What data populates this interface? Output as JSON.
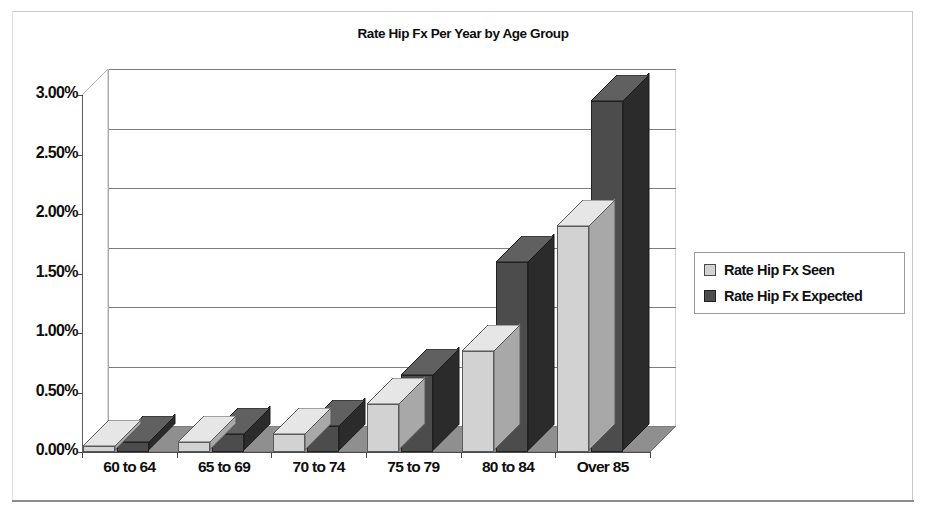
{
  "frame": {
    "present": true
  },
  "chart_data": {
    "type": "bar",
    "title": "Rate Hip Fx Per Year by Age Group",
    "xlabel": "",
    "ylabel": "",
    "categories": [
      "60 to 64",
      "65 to 69",
      "70 to 74",
      "75 to 79",
      "80 to 84",
      "Over 85"
    ],
    "series": [
      {
        "name": "Rate Hip Fx Seen",
        "color": "#d2d2d2",
        "values": [
          0.05,
          0.08,
          0.15,
          0.4,
          0.85,
          1.9
        ]
      },
      {
        "name": "Rate Hip Fx Expected",
        "color": "#4c4c4c",
        "values": [
          0.08,
          0.15,
          0.22,
          0.65,
          1.6,
          2.95
        ]
      }
    ],
    "ylim": [
      0,
      3.0
    ],
    "ytick_step": 0.5,
    "ytick_labels": [
      "0.00%",
      "0.50%",
      "1.00%",
      "1.50%",
      "2.00%",
      "2.50%",
      "3.00%"
    ],
    "ytick_values": [
      0,
      0.5,
      1.0,
      1.5,
      2.0,
      2.5,
      3.0
    ],
    "value_suffix": "%",
    "grid": true,
    "legend_position": "right",
    "perspective": "3d",
    "floor_color": "#8f8f8f",
    "gridline_color": "#7d7d7d",
    "plot_background": "#ffffff"
  },
  "legend": {
    "entries": [
      {
        "label": "Rate Hip Fx Seen",
        "swatch": "seen"
      },
      {
        "label": "Rate Hip Fx Expected",
        "swatch": "exp"
      }
    ]
  }
}
